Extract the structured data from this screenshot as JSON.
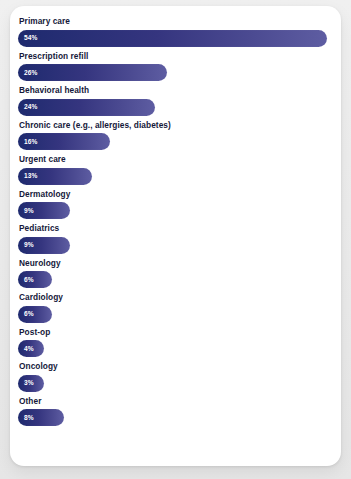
{
  "chart_data": {
    "type": "bar",
    "orientation": "horizontal",
    "title": "",
    "subtitle": "",
    "xlabel": "",
    "ylabel": "",
    "xlim": [
      0,
      54
    ],
    "grid": false,
    "legend": false,
    "value_suffix": "%",
    "categories": [
      "Primary care",
      "Prescription refill",
      "Behavioral health",
      "Chronic care (e.g., allergies, diabetes)",
      "Urgent care",
      "Dermatology",
      "Pediatrics",
      "Neurology",
      "Cardiology",
      "Post-op",
      "Oncology",
      "Other"
    ],
    "values": [
      54,
      26,
      24,
      16,
      13,
      9,
      9,
      6,
      6,
      4,
      3,
      8
    ],
    "value_labels": [
      "54%",
      "26%",
      "24%",
      "16%",
      "13%",
      "9%",
      "9%",
      "6%",
      "6%",
      "4%",
      "3%",
      "8%"
    ],
    "colors": {
      "bar_gradient_start": "#1e2a6e",
      "bar_gradient_end": "#5e5da2",
      "label_text": "#15183a",
      "value_text": "#ffffff",
      "card_background": "#ffffff",
      "page_background": "#ebebeb"
    }
  }
}
